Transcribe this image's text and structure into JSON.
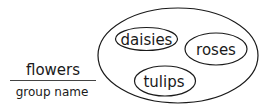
{
  "group": {
    "name": "flowers",
    "caption": "group name"
  },
  "members": [
    {
      "label": "daisies"
    },
    {
      "label": "roses"
    },
    {
      "label": "tulips"
    }
  ],
  "colors": {
    "stroke": "#1a1a1a",
    "background": "#ffffff"
  }
}
